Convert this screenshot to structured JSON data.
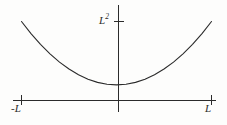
{
  "figure": {
    "name": "parabola-plot",
    "background_color": "#fdfdfc",
    "line_color": "#2b2b2b",
    "label_color": "#2b2b2b"
  },
  "labels": {
    "x_min": "-L",
    "x_max": "L",
    "y_max_base": "L",
    "y_max_exponent": "2"
  },
  "chart_data": {
    "type": "line",
    "title": "",
    "xlabel": "",
    "ylabel": "",
    "grid": false,
    "legend": null,
    "function": "y = x^2",
    "xlim": [
      -1,
      1
    ],
    "ylim": [
      0,
      1
    ],
    "x_tick_labels": [
      "-L",
      "L"
    ],
    "x_tick_values": [
      -1,
      1
    ],
    "y_tick_labels": [
      "L²"
    ],
    "y_tick_values": [
      1
    ],
    "x": [
      -1,
      -0.9,
      -0.8,
      -0.7,
      -0.6,
      -0.5,
      -0.4,
      -0.3,
      -0.2,
      -0.1,
      0,
      0.1,
      0.2,
      0.3,
      0.4,
      0.5,
      0.6,
      0.7,
      0.8,
      0.9,
      1
    ],
    "values": [
      1,
      0.81,
      0.64,
      0.49,
      0.36,
      0.25,
      0.16,
      0.09,
      0.04,
      0.01,
      0,
      0.01,
      0.04,
      0.09,
      0.16,
      0.25,
      0.36,
      0.49,
      0.64,
      0.81,
      1
    ]
  }
}
